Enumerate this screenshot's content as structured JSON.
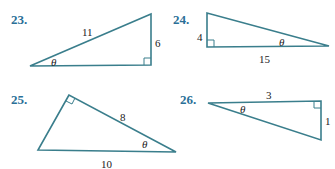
{
  "colors": {
    "background": "#ffffff",
    "problem_number": "#2a6f97",
    "triangle_stroke": "#3a7e8c",
    "label_text": "#222222"
  },
  "problems": [
    {
      "number": "23.",
      "angle_label": "θ",
      "sides": {
        "hypotenuse": "11",
        "opposite": "6"
      },
      "right_angle_position": "bottom-right",
      "theta_position": "bottom-left vertex"
    },
    {
      "number": "24.",
      "angle_label": "θ",
      "sides": {
        "opposite": "4",
        "adjacent": "15"
      },
      "right_angle_position": "bottom-left",
      "theta_position": "right vertex"
    },
    {
      "number": "25.",
      "angle_label": "θ",
      "sides": {
        "adjacent": "8",
        "hypotenuse": "10"
      },
      "right_angle_position": "top",
      "theta_position": "bottom-right vertex"
    },
    {
      "number": "26.",
      "angle_label": "θ",
      "sides": {
        "adjacent": "3",
        "opposite": "1"
      },
      "right_angle_position": "top-right",
      "theta_position": "left vertex"
    }
  ]
}
